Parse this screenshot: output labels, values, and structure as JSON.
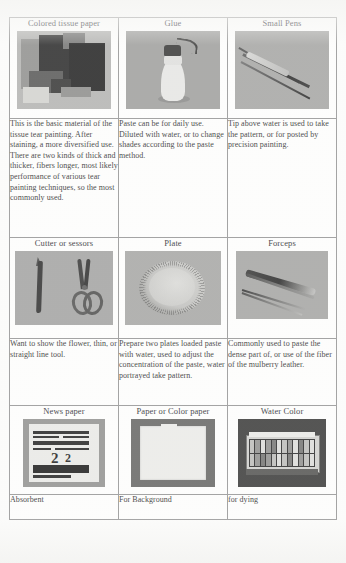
{
  "document": {
    "type": "scanned-table",
    "columns": 3,
    "rows": 3
  },
  "table": {
    "rows": [
      {
        "cells": [
          {
            "caption": "Colored tissue paper",
            "image": "colored-tissue-paper-photo",
            "description": "This is the basic material of the tissue tear painting. After staining, a more diversified use. There are two kinds of thick and thicker, fibers longer, most likely performance of various tear painting techniques, so the most commonly used."
          },
          {
            "caption": "Glue",
            "image": "glue-bottle-photo",
            "description": "Paste can be for daily use. Diluted with water, or to change shades according to the paste method."
          },
          {
            "caption": "Small Pens",
            "image": "small-pens-photo",
            "description": "Tip above water is used to take the pattern, or for posted by precision painting."
          }
        ]
      },
      {
        "cells": [
          {
            "caption": "Cutter or sessors",
            "image": "cutter-and-scissors-photo",
            "description": "Want to show the flower, thin, or straight line tool."
          },
          {
            "caption": "Plate",
            "image": "plate-photo",
            "description": "Prepare two plates loaded paste with water, used to adjust the concentration of the paste, water portrayed take pattern."
          },
          {
            "caption": "Forceps",
            "image": "forceps-photo",
            "description": "Commonly used to paste the dense part of, or use of the fiber of the mulberry leather."
          }
        ]
      },
      {
        "cells": [
          {
            "caption": "News paper",
            "image": "newspaper-photo",
            "description": "Absorbent"
          },
          {
            "caption": "Paper or Color paper",
            "image": "blank-paper-photo",
            "description": "For Background"
          },
          {
            "caption": "Water Color",
            "image": "water-color-palette-photo",
            "description": "for dying"
          }
        ]
      }
    ]
  },
  "colors": {
    "page_background": "#fbfbfa",
    "cell_background": "#fdfdfc",
    "border": "#8e8e8e",
    "text": "#232323"
  }
}
